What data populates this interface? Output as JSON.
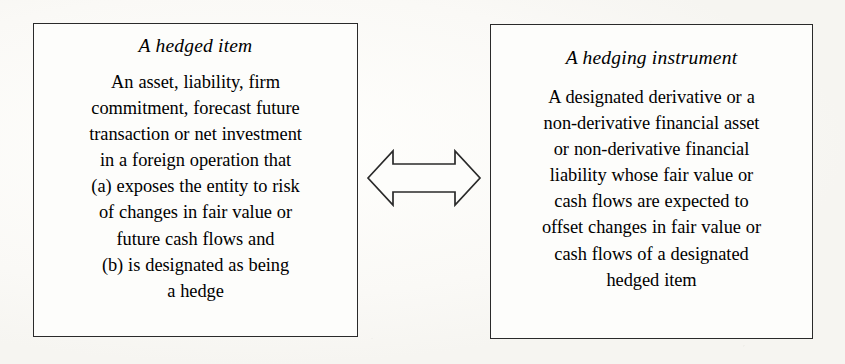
{
  "figure": {
    "background_color": "#fcfbf8",
    "ink_color": "#2a2a2a",
    "kind": "two-box concept diagram with bidirectional arrow"
  },
  "left_box": {
    "heading": "A hedged item",
    "body_lines": [
      "An asset, liability, firm",
      "commitment, forecast future",
      "transaction or net investment",
      "in a foreign operation that",
      "(a) exposes the entity to risk",
      "of changes in fair value or",
      "future cash flows and",
      "(b) is designated as being",
      "a hedge"
    ]
  },
  "right_box": {
    "heading": "A hedging instrument",
    "body_lines": [
      "A designated derivative or a",
      "non-derivative financial asset",
      "or non-derivative financial",
      "liability whose fair value or",
      "cash flows are expected to",
      "offset changes in fair value or",
      "cash flows of a designated",
      "hedged item"
    ]
  },
  "connector": {
    "icon": "double-headed-arrow-icon",
    "direction": "bidirectional",
    "style": "outlined block arrow",
    "stroke_color": "#2a2a2a",
    "fill_color": "#fdfdfb"
  }
}
